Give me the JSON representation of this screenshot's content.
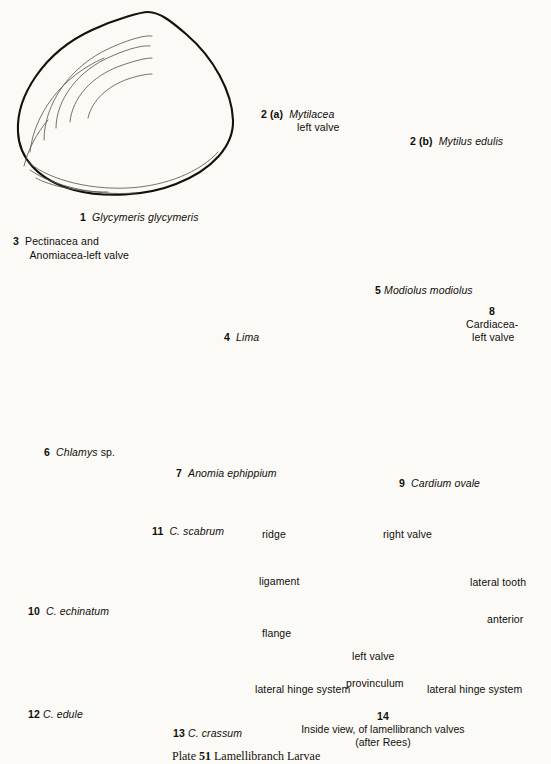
{
  "plate": {
    "background_color": "#fbfaf6",
    "ink_color": "#14110d",
    "caption_number": "51",
    "caption_prefix": "Plate ",
    "caption_text": " Lamellibranch Larvae"
  },
  "figures": [
    {
      "id": "1",
      "number": "1",
      "name": "Glycymeris glycymeris",
      "style": "italic",
      "label": "1  Glycymeris glycymeris"
    },
    {
      "id": "2a",
      "number": "2 (a)",
      "name": "Mytilacea",
      "line2": "left valve",
      "style": "italic",
      "label": "2 (a)  Mytilacea"
    },
    {
      "id": "2b",
      "number": "2 (b)",
      "name": "Mytilus edulis",
      "style": "italic",
      "label": "2 (b)  Mytilus edulis"
    },
    {
      "id": "3",
      "number": "3",
      "name": "Pectinacea and",
      "line2": "Anomiacea-left valve",
      "style": "roman",
      "label": "3  Pectinacea and"
    },
    {
      "id": "4",
      "number": "4",
      "name": "Lima",
      "style": "italic",
      "label": "4  Lima"
    },
    {
      "id": "5",
      "number": "5",
      "name": "Modiolus modiolus",
      "style": "italic",
      "label": "5  Modiolus modiolus"
    },
    {
      "id": "6",
      "number": "6",
      "name": "Chlamys",
      "suffix": "sp.",
      "style": "italic",
      "label": "6  Chlamys sp."
    },
    {
      "id": "7",
      "number": "7",
      "name": "Anomia ephippium",
      "style": "italic",
      "label": "7  Anomia ephippium"
    },
    {
      "id": "8",
      "number": "8",
      "name": "Cardiacea-",
      "line2": "left valve",
      "style": "roman",
      "label": "8 Cardiacea-left valve"
    },
    {
      "id": "9",
      "number": "9",
      "name": "Cardium ovale",
      "style": "italic",
      "label": "9  Cardium ovale"
    },
    {
      "id": "10",
      "number": "10",
      "name": "C. echinatum",
      "style": "italic",
      "label": "10  C. echinatum"
    },
    {
      "id": "11",
      "number": "11",
      "name": "C. scabrum",
      "style": "italic",
      "label": "11  C. scabrum"
    },
    {
      "id": "12",
      "number": "12",
      "name": "C. edule",
      "style": "italic",
      "label": "12 C. edule"
    },
    {
      "id": "13",
      "number": "13",
      "name": "C. crassum",
      "style": "italic",
      "label": "13 C. crassum"
    },
    {
      "id": "14",
      "number": "14",
      "name": "Inside view, of lamellibranch valves",
      "line2": "(after Rees)",
      "style": "roman",
      "label": "14 Inside view, of lamellibranch valves (after Rees)"
    }
  ],
  "fig1": {
    "num": "1",
    "name": "Glycymeris glycymeris"
  },
  "fig2a": {
    "num": "2 (a)",
    "name": "Mytilacea",
    "line2": "left valve"
  },
  "fig2b": {
    "num": "2 (b)",
    "name": "Mytilus edulis"
  },
  "fig3": {
    "num": "3",
    "line1": "Pectinacea and",
    "line2": "Anomiacea-left valve"
  },
  "fig4": {
    "num": "4",
    "name": "Lima"
  },
  "fig5": {
    "num": "5",
    "name": "Modiolus modiolus"
  },
  "fig6": {
    "num": "6",
    "name": "Chlamys",
    "suffix": "sp."
  },
  "fig7": {
    "num": "7",
    "name": "Anomia ephippium"
  },
  "fig8": {
    "num": "8",
    "line1": "Cardiacea-",
    "line2": "left valve"
  },
  "fig9": {
    "num": "9",
    "name": "Cardium ovale"
  },
  "fig10": {
    "num": "10",
    "name": "C. echinatum"
  },
  "fig11": {
    "num": "11",
    "name": "C. scabrum"
  },
  "fig12": {
    "num": "12",
    "name": "C. edule"
  },
  "fig13": {
    "num": "13",
    "name": "C. crassum"
  },
  "fig14": {
    "num": "14",
    "title": "Inside view, of lamellibranch valves",
    "attribution": "(after Rees)",
    "callouts": {
      "ridge": "ridge",
      "ligament": "ligament",
      "flange": "flange",
      "right_valve": "right valve",
      "left_valve": "left valve",
      "lateral_tooth": "lateral tooth",
      "anterior": "anterior",
      "provinculum": "provinculum",
      "lateral_hinge_left": "lateral hinge system",
      "lateral_hinge_right": "lateral hinge system"
    }
  },
  "bottom_caption": {
    "prefix": "Plate ",
    "number": "51",
    "text": " Lamellibranch Larvae"
  }
}
